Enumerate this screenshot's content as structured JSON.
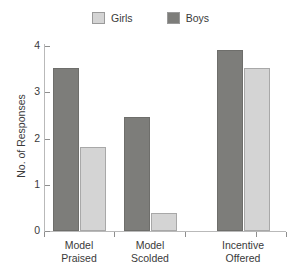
{
  "chart_data": {
    "type": "bar",
    "title": "",
    "subtitle": "",
    "xlabel": "",
    "ylabel": "No. of Responses",
    "ylim": [
      0,
      4
    ],
    "yticks": [
      0,
      1,
      2,
      3,
      4
    ],
    "ytick_labels": [
      "0",
      "1",
      "2",
      "3",
      "4"
    ],
    "grid": false,
    "legend_position": "top-center",
    "categories": [
      "Model Praised",
      "Model Scolded",
      "Incentive Offered"
    ],
    "category_lines": [
      [
        "Model",
        "Praised"
      ],
      [
        "Model",
        "Scolded"
      ],
      [
        "Incentive",
        "Offered"
      ]
    ],
    "series": [
      {
        "name": "Boys",
        "color": "#7d7d7a",
        "values": [
          3.52,
          2.46,
          3.92
        ]
      },
      {
        "name": "Girls",
        "color": "#d4d4d4",
        "values": [
          1.82,
          0.4,
          3.52
        ]
      }
    ],
    "series_order_in_plot": [
      "Boys",
      "Girls"
    ],
    "legend_order": [
      "Girls",
      "Boys"
    ]
  },
  "legend": {
    "items": [
      {
        "label": "Girls",
        "swatch": "legend-swatch-girls"
      },
      {
        "label": "Boys",
        "swatch": "legend-swatch-boys"
      }
    ]
  },
  "axes": {
    "y_title": "No. of Responses",
    "y_labels": [
      "4",
      "3",
      "2",
      "1",
      "0"
    ]
  },
  "categories_text": [
    {
      "line1": "Model",
      "line2": "Praised"
    },
    {
      "line1": "Model",
      "line2": "Scolded"
    },
    {
      "line1": "Incentive",
      "line2": "Offered"
    }
  ],
  "colors": {
    "boys": "#7d7d7a",
    "girls": "#d4d4d4",
    "axis": "#b9b9b9",
    "text": "#3a3a3a",
    "background": "#ffffff"
  }
}
